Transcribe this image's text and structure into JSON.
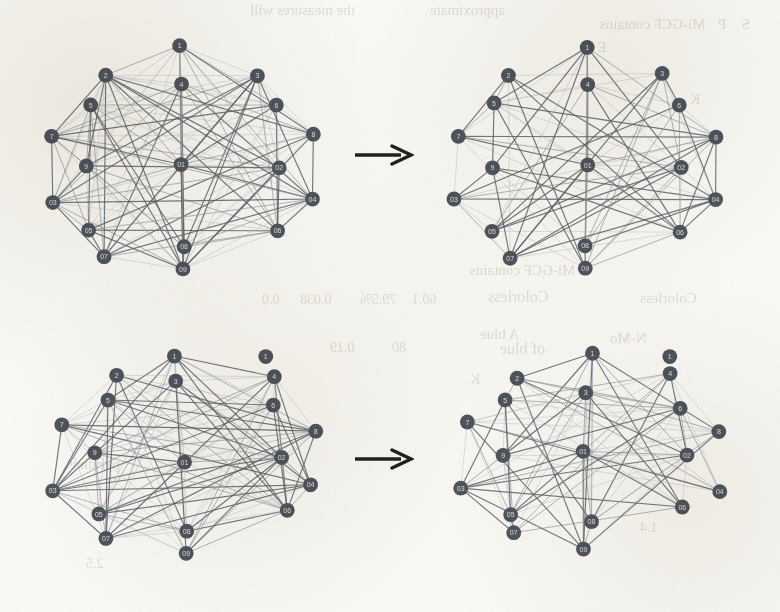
{
  "figure": {
    "kind": "graph-sparsification-figure",
    "background_color": "#fbfaf7",
    "node_color": "#4b5159",
    "node_label_color": "#e8e8ea",
    "edge_color_dark": "#5a5f66",
    "edge_color_light": "#b9bcc1",
    "arrow_color": "#1c1c1c",
    "rows": 2,
    "columns": 2,
    "arrow_symbol": "→"
  },
  "bleed_text": [
    {
      "text": "the measures will",
      "x": 250,
      "y": 2,
      "size": 15
    },
    {
      "text": "approximate",
      "x": 430,
      "y": 2,
      "size": 15
    },
    {
      "text": "Mi-GCF contains",
      "x": 600,
      "y": 16,
      "size": 15
    },
    {
      "text": "P",
      "x": 718,
      "y": 16,
      "size": 15
    },
    {
      "text": "S",
      "x": 742,
      "y": 16,
      "size": 15
    },
    {
      "text": "E",
      "x": 598,
      "y": 40,
      "size": 14
    },
    {
      "text": "K",
      "x": 690,
      "y": 92,
      "size": 14
    },
    {
      "text": "Mi-GCF contains",
      "x": 470,
      "y": 262,
      "size": 15
    },
    {
      "text": "Colorless",
      "x": 488,
      "y": 288,
      "size": 16
    },
    {
      "text": "0.038",
      "x": 300,
      "y": 292,
      "size": 14
    },
    {
      "text": "79.5%",
      "x": 360,
      "y": 292,
      "size": 14
    },
    {
      "text": "60.1",
      "x": 412,
      "y": 292,
      "size": 14
    },
    {
      "text": "0.0",
      "x": 262,
      "y": 292,
      "size": 14
    },
    {
      "text": "Colorless",
      "x": 640,
      "y": 290,
      "size": 15
    },
    {
      "text": "of blue",
      "x": 500,
      "y": 340,
      "size": 16
    },
    {
      "text": "A blue",
      "x": 480,
      "y": 326,
      "size": 15
    },
    {
      "text": "N-Mo",
      "x": 610,
      "y": 330,
      "size": 15
    },
    {
      "text": "0.19",
      "x": 330,
      "y": 340,
      "size": 14
    },
    {
      "text": "80",
      "x": 392,
      "y": 340,
      "size": 14
    },
    {
      "text": "K",
      "x": 470,
      "y": 372,
      "size": 14
    },
    {
      "text": "pyridine",
      "x": 70,
      "y": 456,
      "size": 15
    },
    {
      "text": "1.4",
      "x": 640,
      "y": 520,
      "size": 14
    },
    {
      "text": "2.5",
      "x": 86,
      "y": 556,
      "size": 14
    }
  ],
  "panels": [
    {
      "name": "top-left-dense-graph",
      "role": "input-dense-graph",
      "x": 14,
      "y": 18,
      "width": 336,
      "height": 272,
      "node_count": 18,
      "edge_count": 130,
      "has_isolated_node": false
    },
    {
      "name": "top-right-sparse-graph",
      "role": "output-sparsified-graph",
      "x": 418,
      "y": 18,
      "width": 336,
      "height": 272,
      "node_count": 18,
      "edge_count": 88,
      "has_isolated_node": false
    },
    {
      "name": "bottom-left-dense-graph",
      "role": "input-dense-graph",
      "x": 14,
      "y": 330,
      "width": 336,
      "height": 272,
      "node_count": 18,
      "edge_count": 118,
      "has_isolated_node": true
    },
    {
      "name": "bottom-right-sparse-graph",
      "role": "output-sparsified-graph",
      "x": 418,
      "y": 330,
      "width": 336,
      "height": 272,
      "node_count": 18,
      "edge_count": 86,
      "has_isolated_node": true
    }
  ],
  "arrows": [
    {
      "name": "arrow-top",
      "x": 352,
      "y": 138,
      "width": 62,
      "height": 34,
      "label": "→"
    },
    {
      "name": "arrow-bottom",
      "x": 352,
      "y": 442,
      "width": 62,
      "height": 34,
      "label": "→"
    }
  ],
  "node_labels": [
    "1",
    "2",
    "3",
    "4",
    "5",
    "6",
    "7",
    "8",
    "9",
    "01",
    "02",
    "03",
    "04",
    "05",
    "06",
    "07",
    "08",
    "09"
  ],
  "chart_data": {
    "type": "network",
    "title": "",
    "node_count_per_graph": 18,
    "graphs": [
      {
        "id": "top-left",
        "label": "dense input graph (row 1)",
        "layout": "circular-ellipse",
        "nodes": [
          {
            "id": "1",
            "x": 0.5,
            "y": 0.04,
            "label": "13"
          },
          {
            "id": "2",
            "x": 0.23,
            "y": 0.16,
            "label": "05"
          },
          {
            "id": "3",
            "x": 0.77,
            "y": 0.16,
            "label": "2"
          },
          {
            "id": "4",
            "x": 0.5,
            "y": 0.2,
            "label": "03"
          },
          {
            "id": "5",
            "x": 0.18,
            "y": 0.29,
            "label": "07"
          },
          {
            "id": "6",
            "x": 0.82,
            "y": 0.29,
            "label": "11"
          },
          {
            "id": "7",
            "x": 0.05,
            "y": 0.42,
            "label": "01"
          },
          {
            "id": "8",
            "x": 0.95,
            "y": 0.42,
            "label": "9"
          },
          {
            "id": "9",
            "x": 0.17,
            "y": 0.57,
            "label": "06"
          },
          {
            "id": "10",
            "x": 0.5,
            "y": 0.55,
            "label": "07"
          },
          {
            "id": "11",
            "x": 0.83,
            "y": 0.57,
            "label": "12"
          },
          {
            "id": "12",
            "x": 0.04,
            "y": 0.72,
            "label": "02"
          },
          {
            "id": "13",
            "x": 0.96,
            "y": 0.72,
            "label": "10"
          },
          {
            "id": "14",
            "x": 0.17,
            "y": 0.84,
            "label": "04"
          },
          {
            "id": "15",
            "x": 0.83,
            "y": 0.84,
            "label": "14"
          },
          {
            "id": "16",
            "x": 0.23,
            "y": 0.95,
            "label": "15"
          },
          {
            "id": "17",
            "x": 0.5,
            "y": 0.92,
            "label": "04"
          },
          {
            "id": "18",
            "x": 0.5,
            "y": 1.02,
            "label": "16"
          }
        ],
        "density": "high"
      },
      {
        "id": "top-right",
        "label": "sparsified output graph (row 1)",
        "layout": "circular-ellipse",
        "density": "medium"
      },
      {
        "id": "bottom-left",
        "label": "dense input graph (row 2)",
        "layout": "irregular-ellipse",
        "density": "high",
        "isolated_nodes": 1
      },
      {
        "id": "bottom-right",
        "label": "sparsified output graph (row 2)",
        "layout": "irregular-ellipse",
        "density": "medium",
        "isolated_nodes": 1
      }
    ]
  }
}
